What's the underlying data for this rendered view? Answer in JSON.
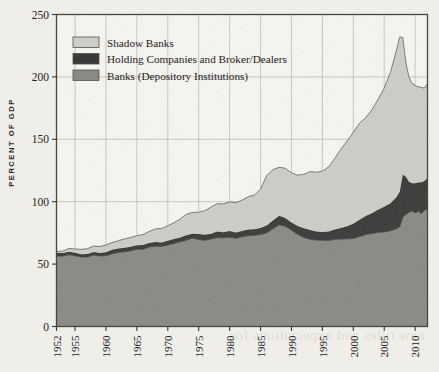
{
  "page": {
    "bleed_lines": [
      "the Fed an accommodating view, warning against raising",
      "rates too quickly. Conservatives had long warned of",
      "the risk of inflation, but never quite as stridently as",
      "their counterparts. Fed's shadow in the economy for",
      "years before. Americans could help dictate a new",
      "consensus about the economy without a prolonged",
      "downturn. As events, having essentially stopped",
      "from the government in 2008 and fell as",
      "the bubble collapsed in the economy and in",
      "the United States was the exception among",
      "bank regulators in the post-crisis years",
      "of the largest institutions, and the",
      "new rules and expectations for"
    ]
  },
  "chart_data": {
    "type": "area",
    "stacked": true,
    "title": "",
    "subtitle": "",
    "xlabel": "",
    "ylabel": "PERCENT OF GDP",
    "xlim": [
      1952,
      2012
    ],
    "ylim": [
      0,
      250
    ],
    "ytick_values": [
      0,
      50,
      100,
      150,
      200,
      250
    ],
    "ytick_labels": [
      "0",
      "50",
      "100",
      "150",
      "200",
      "250"
    ],
    "xtick_values": [
      1952,
      1955,
      1960,
      1965,
      1970,
      1975,
      1980,
      1985,
      1990,
      1995,
      2000,
      2005,
      2010
    ],
    "xtick_labels": [
      "1952",
      "1955",
      "1960",
      "1965",
      "1970",
      "1975",
      "1980",
      "1985",
      "1990",
      "1995",
      "2000",
      "2005",
      "2010"
    ],
    "grid": "both",
    "grid_color": "#b9b5ad",
    "legend_position": "top-left",
    "x": [
      1952,
      1953,
      1954,
      1955,
      1956,
      1957,
      1958,
      1959,
      1960,
      1961,
      1962,
      1963,
      1964,
      1965,
      1966,
      1967,
      1968,
      1969,
      1970,
      1971,
      1972,
      1973,
      1974,
      1975,
      1976,
      1977,
      1978,
      1979,
      1980,
      1981,
      1982,
      1983,
      1984,
      1985,
      1986,
      1987,
      1988,
      1989,
      1990,
      1991,
      1992,
      1993,
      1994,
      1995,
      1996,
      1997,
      1998,
      1999,
      2000,
      2001,
      2002,
      2003,
      2004,
      2005,
      2006,
      2007,
      2007.5,
      2008,
      2008.5,
      2009,
      2009.5,
      2010,
      2010.5,
      2011,
      2011.5,
      2012
    ],
    "series": [
      {
        "name": "Banks (Depository Institutions)",
        "color": "#8a8984",
        "values": [
          56.5,
          56.0,
          57.5,
          56.5,
          55.5,
          55.5,
          57.0,
          56.5,
          57.0,
          58.5,
          59.5,
          60.0,
          61.0,
          62.0,
          62.0,
          63.5,
          64.0,
          64.0,
          65.0,
          66.5,
          67.5,
          69.0,
          70.5,
          70.0,
          69.5,
          70.5,
          71.5,
          71.5,
          72.0,
          71.0,
          71.5,
          72.5,
          73.0,
          73.5,
          75.0,
          78.0,
          81.0,
          80.0,
          77.5,
          74.0,
          71.5,
          70.0,
          69.5,
          69.5,
          69.0,
          69.5,
          70.0,
          70.0,
          70.5,
          72.0,
          73.5,
          74.5,
          75.5,
          76.0,
          77.0,
          78.5,
          80.0,
          88.0,
          90.0,
          92.0,
          92.5,
          91.0,
          92.0,
          90.5,
          93.0,
          94.5
        ]
      },
      {
        "name": "Holding Companies and Broker/Dealers",
        "color": "#3c3a38",
        "values": [
          2.5,
          2.5,
          2.5,
          2.5,
          2.5,
          2.5,
          2.5,
          2.5,
          3.0,
          3.0,
          3.0,
          3.0,
          3.0,
          3.0,
          3.0,
          3.0,
          3.5,
          3.5,
          3.5,
          3.5,
          3.5,
          4.0,
          4.0,
          4.0,
          4.0,
          4.0,
          4.5,
          4.5,
          4.5,
          4.5,
          4.5,
          5.0,
          5.0,
          5.5,
          6.0,
          7.0,
          7.5,
          6.5,
          6.0,
          6.5,
          7.0,
          7.0,
          6.5,
          6.5,
          7.0,
          7.5,
          9.0,
          10.5,
          12.0,
          13.5,
          15.0,
          16.5,
          18.5,
          20.0,
          22.0,
          25.0,
          28.0,
          34.0,
          30.0,
          24.0,
          22.0,
          24.0,
          23.0,
          25.0,
          24.0,
          24.5
        ]
      },
      {
        "name": "Shadow Banks",
        "color": "#cfcdc7",
        "values": [
          1.5,
          2.0,
          2.5,
          3.0,
          3.5,
          4.0,
          4.5,
          5.0,
          5.5,
          6.0,
          6.5,
          7.0,
          7.5,
          8.0,
          8.5,
          9.5,
          10.5,
          11.0,
          11.5,
          13.0,
          14.5,
          16.5,
          17.0,
          17.5,
          19.5,
          21.5,
          22.5,
          23.0,
          23.5,
          24.0,
          25.0,
          26.5,
          27.5,
          31.0,
          40.0,
          40.5,
          38.5,
          39.5,
          39.5,
          41.0,
          43.5,
          47.0,
          48.0,
          49.0,
          52.0,
          57.0,
          63.0,
          68.0,
          73.0,
          77.0,
          78.5,
          82.5,
          88.0,
          95.0,
          105.0,
          118.0,
          124.0,
          110.0,
          92.0,
          84.0,
          80.0,
          78.0,
          76.5,
          76.0,
          74.0,
          75.5
        ]
      }
    ],
    "notes": {
      "total_peak_value": 232,
      "total_peak_year": 2008,
      "total_start_value": 60.5,
      "total_end_value": 194
    }
  },
  "legend": {
    "items": [
      {
        "label": "Shadow Banks",
        "swatch": "#cfcdc7"
      },
      {
        "label": "Holding Companies and Broker/Dealers",
        "swatch": "#3c3a38"
      },
      {
        "label": "Banks (Depository Institutions)",
        "swatch": "#8a8984"
      }
    ]
  }
}
